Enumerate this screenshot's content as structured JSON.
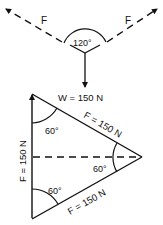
{
  "space_diagram": {
    "left_force_label": "F",
    "right_force_label": "F",
    "angle_label": "120°",
    "weight_label": "W = 150 N"
  },
  "force_triangle": {
    "left_side_label": "F = 150 N",
    "top_side_label": "F = 150 N",
    "bottom_side_label": "F = 150 N",
    "angle_top_left": "60°",
    "angle_right": "60°",
    "angle_bottom_left": "60°"
  },
  "colors": {
    "line": "#111111",
    "background": "#ffffff"
  }
}
